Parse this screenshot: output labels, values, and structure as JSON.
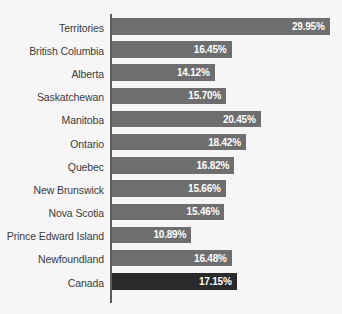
{
  "chart_data": {
    "type": "bar",
    "orientation": "horizontal",
    "title": "",
    "subtitle": "",
    "xlabel": "",
    "ylabel": "",
    "xlim": [
      0,
      30
    ],
    "grid": false,
    "legend": null,
    "value_suffix": "%",
    "categories": [
      "Territories",
      "British Columbia",
      "Alberta",
      "Saskatchewan",
      "Manitoba",
      "Ontario",
      "Quebec",
      "New Brunswick",
      "Nova Scotia",
      "Prince Edward Island",
      "Newfoundland",
      "Canada"
    ],
    "values": [
      29.95,
      16.45,
      14.12,
      15.7,
      20.45,
      18.42,
      16.82,
      15.66,
      15.46,
      10.89,
      16.48,
      17.15
    ],
    "value_labels": [
      "29.95%",
      "16.45%",
      "14.12%",
      "15.70%",
      "20.45%",
      "18.42%",
      "16.82%",
      "15.66%",
      "15.46%",
      "10.89%",
      "16.48%",
      "17.15%"
    ],
    "highlight_index": 11,
    "colors": {
      "bar": "#6e6e6e",
      "bar_highlight": "#2a2a2a",
      "value_text": "#ffffff",
      "category_text": "#3b3b3b",
      "axis": "#5d5d5d",
      "background": "#f6f6f6"
    }
  }
}
